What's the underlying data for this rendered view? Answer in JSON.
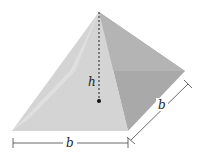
{
  "diagram": {
    "labels": {
      "height": "h",
      "base_front": "b",
      "base_side": "b"
    },
    "colors": {
      "left_face": "#ececec",
      "front_face": "#d2d2d2",
      "right_face": "#a9a9a9",
      "back_face": "#b8b8b8",
      "lines": "#333333"
    }
  }
}
